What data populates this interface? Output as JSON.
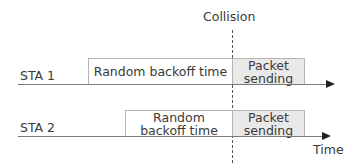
{
  "diagram": {
    "collision_label": "Collision",
    "time_label": "Time",
    "rows": [
      {
        "station": "STA 1",
        "backoff_label": "Random backoff time",
        "packet_label_line1": "Packet",
        "packet_label_line2": "sending"
      },
      {
        "station": "STA 2",
        "backoff_label_line1": "Random",
        "backoff_label_line2": "backoff time",
        "packet_label_line1": "Packet",
        "packet_label_line2": "sending"
      }
    ],
    "colors": {
      "packet_fill": "#e9e9e9",
      "box_border": "#b5b5b5",
      "axis": "#7a7a7a",
      "collision_line": "#555555"
    }
  }
}
